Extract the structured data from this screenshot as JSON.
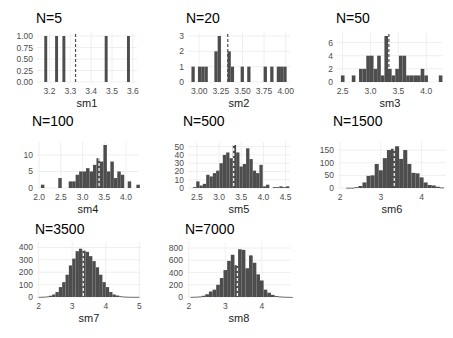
{
  "colors": {
    "bar": "#4d4d4d",
    "grid": "#ebebeb",
    "tick_text": "#4d4d4d",
    "mean_line": "#4d4d4d"
  },
  "chart_data": [
    {
      "type": "bar",
      "title": "N=5",
      "xlabel": "sm1",
      "ylabel": "",
      "xlim": [
        3.14,
        3.62
      ],
      "ylim": [
        0,
        1.0
      ],
      "xticks": [
        "3.2",
        "3.3",
        "3.4",
        "3.5",
        "3.6"
      ],
      "xtick_values": [
        3.2,
        3.3,
        3.4,
        3.5,
        3.6
      ],
      "yticks": [
        "0.00",
        "0.25",
        "0.50",
        "0.75",
        "1.00"
      ],
      "ytick_values": [
        0,
        0.25,
        0.5,
        0.75,
        1.0
      ],
      "bin_width": 0.014,
      "mean": 3.325,
      "bins_x": [
        3.175,
        3.227,
        3.262,
        3.465,
        3.572
      ],
      "values": [
        1,
        1,
        1,
        1,
        1
      ]
    },
    {
      "type": "bar",
      "title": "N=20",
      "xlabel": "sm2",
      "ylabel": "",
      "xlim": [
        2.87,
        4.05
      ],
      "ylim": [
        0,
        3
      ],
      "xticks": [
        "3.00",
        "3.25",
        "3.50",
        "3.75",
        "4.00"
      ],
      "xtick_values": [
        3.0,
        3.25,
        3.5,
        3.75,
        4.0
      ],
      "yticks": [
        "0",
        "1",
        "2",
        "3"
      ],
      "ytick_values": [
        0,
        1,
        2,
        3
      ],
      "bin_width": 0.038,
      "mean": 3.33,
      "bins_x": [
        2.91,
        2.985,
        3.023,
        3.061,
        3.175,
        3.213,
        3.327,
        3.365,
        3.479,
        3.555,
        3.745,
        3.821,
        3.897,
        3.935,
        3.973
      ],
      "values": [
        1,
        1,
        1,
        1,
        2,
        3,
        2,
        1,
        1,
        1,
        1,
        1,
        1,
        1,
        1
      ]
    },
    {
      "type": "bar",
      "title": "N=50",
      "xlabel": "sm3",
      "ylabel": "",
      "xlim": [
        2.4,
        4.3
      ],
      "ylim": [
        0,
        7
      ],
      "xticks": [
        "2.5",
        "3.0",
        "3.5",
        "4.0"
      ],
      "xtick_values": [
        2.5,
        3.0,
        3.5,
        4.0
      ],
      "yticks": [
        "0",
        "2",
        "4",
        "6"
      ],
      "ytick_values": [
        0,
        2,
        4,
        6
      ],
      "bin_width": 0.065,
      "mean": 3.33,
      "bins_x": [
        2.47,
        2.665,
        2.795,
        2.86,
        2.925,
        2.99,
        3.055,
        3.12,
        3.185,
        3.25,
        3.315,
        3.38,
        3.445,
        3.51,
        3.575,
        3.64,
        3.705,
        3.77,
        3.835,
        3.9,
        3.965,
        4.225
      ],
      "values": [
        1,
        1,
        2,
        2,
        4,
        4,
        2,
        4,
        1,
        7,
        2,
        1,
        2,
        4,
        4,
        1,
        1,
        1,
        1,
        2,
        1,
        1
      ]
    },
    {
      "type": "bar",
      "title": "N=100",
      "xlabel": "sm4",
      "ylabel": "",
      "xlim": [
        1.95,
        4.3
      ],
      "ylim": [
        0,
        13
      ],
      "xticks": [
        "2.0",
        "2.5",
        "3.0",
        "3.5",
        "4.0"
      ],
      "xtick_values": [
        2.0,
        2.5,
        3.0,
        3.5,
        4.0
      ],
      "yticks": [
        "0",
        "5",
        "10"
      ],
      "ytick_values": [
        0,
        5,
        10
      ],
      "bin_width": 0.08,
      "mean": 3.38,
      "bins_x": [
        2.04,
        2.44,
        2.68,
        2.76,
        2.84,
        2.92,
        3.0,
        3.08,
        3.16,
        3.24,
        3.32,
        3.4,
        3.48,
        3.56,
        3.64,
        3.72,
        3.8,
        3.88,
        4.04,
        4.24
      ],
      "values": [
        1,
        3,
        2,
        2,
        4,
        5,
        5,
        6,
        5,
        7,
        9,
        8,
        13,
        5,
        8,
        3,
        5,
        4,
        2,
        1
      ]
    },
    {
      "type": "bar",
      "title": "N=500",
      "xlabel": "sm5",
      "ylabel": "",
      "xlim": [
        2.3,
        4.6
      ],
      "ylim": [
        0,
        52
      ],
      "xticks": [
        "2.5",
        "3.0",
        "3.5",
        "4.0",
        "4.5"
      ],
      "xtick_values": [
        2.5,
        3.0,
        3.5,
        4.0,
        4.5
      ],
      "yticks": [
        "0",
        "10",
        "20",
        "30",
        "40",
        "50"
      ],
      "ytick_values": [
        0,
        10,
        20,
        30,
        40,
        50
      ],
      "bin_width": 0.075,
      "mean": 3.33,
      "bins_x": [
        2.41,
        2.485,
        2.56,
        2.635,
        2.71,
        2.785,
        2.86,
        2.935,
        3.01,
        3.085,
        3.16,
        3.235,
        3.31,
        3.385,
        3.46,
        3.535,
        3.61,
        3.685,
        3.76,
        3.835,
        3.91,
        3.985,
        4.06,
        4.21,
        4.285,
        4.36,
        4.435,
        4.51
      ],
      "values": [
        1,
        8,
        3,
        5,
        16,
        14,
        18,
        21,
        30,
        40,
        43,
        36,
        52,
        43,
        26,
        29,
        48,
        35,
        21,
        18,
        28,
        2,
        4,
        1,
        1,
        2,
        1,
        2
      ]
    },
    {
      "type": "bar",
      "title": "N=1500",
      "xlabel": "sm6",
      "ylabel": "",
      "xlim": [
        1.95,
        4.6
      ],
      "ylim": [
        0,
        170
      ],
      "xticks": [
        "2",
        "3",
        "4"
      ],
      "xtick_values": [
        2,
        3,
        4
      ],
      "yticks": [
        "0",
        "50",
        "100",
        "150"
      ],
      "ytick_values": [
        0,
        50,
        100,
        150
      ],
      "bin_width": 0.1,
      "mean": 3.33,
      "bins_x": [
        2.15,
        2.25,
        2.35,
        2.45,
        2.55,
        2.65,
        2.75,
        2.85,
        2.95,
        3.05,
        3.15,
        3.25,
        3.35,
        3.45,
        3.55,
        3.65,
        3.75,
        3.85,
        3.95,
        4.05,
        4.15,
        4.25,
        4.35,
        4.45
      ],
      "values": [
        1,
        1,
        3,
        8,
        22,
        48,
        50,
        95,
        70,
        118,
        150,
        155,
        165,
        115,
        150,
        95,
        60,
        58,
        42,
        22,
        12,
        10,
        5,
        2
      ]
    },
    {
      "type": "bar",
      "title": "N=3500",
      "xlabel": "sm7",
      "ylabel": "",
      "xlim": [
        1.95,
        5.05
      ],
      "ylim": [
        0,
        420
      ],
      "xticks": [
        "2",
        "3",
        "4",
        "5"
      ],
      "xtick_values": [
        2,
        3,
        4,
        5
      ],
      "yticks": [
        "0",
        "100",
        "200",
        "300",
        "400"
      ],
      "ytick_values": [
        0,
        100,
        200,
        300,
        400
      ],
      "bin_width": 0.1,
      "mean": 3.33,
      "bins_x": [
        2.0,
        2.1,
        2.2,
        2.3,
        2.4,
        2.5,
        2.6,
        2.7,
        2.8,
        2.9,
        3.0,
        3.1,
        3.2,
        3.3,
        3.4,
        3.5,
        3.6,
        3.7,
        3.8,
        3.9,
        4.0,
        4.1,
        4.2,
        4.3,
        4.4,
        4.5,
        4.6,
        4.7,
        4.8,
        4.9
      ],
      "values": [
        1,
        2,
        4,
        10,
        20,
        40,
        80,
        120,
        180,
        255,
        310,
        370,
        390,
        375,
        365,
        330,
        290,
        240,
        180,
        120,
        80,
        40,
        20,
        12,
        6,
        3,
        2,
        1,
        1,
        1
      ]
    },
    {
      "type": "bar",
      "title": "N=7000",
      "xlabel": "sm8",
      "ylabel": "",
      "xlim": [
        1.95,
        4.8
      ],
      "ylim": [
        0,
        850
      ],
      "xticks": [
        "2",
        "3",
        "4"
      ],
      "xtick_values": [
        2,
        3,
        4
      ],
      "yticks": [
        "0",
        "200",
        "400",
        "600",
        "800"
      ],
      "ytick_values": [
        0,
        200,
        400,
        600,
        800
      ],
      "bin_width": 0.1,
      "mean": 3.33,
      "bins_x": [
        2.05,
        2.15,
        2.25,
        2.35,
        2.45,
        2.55,
        2.65,
        2.75,
        2.85,
        2.95,
        3.05,
        3.15,
        3.25,
        3.35,
        3.45,
        3.55,
        3.65,
        3.75,
        3.85,
        3.95,
        4.05,
        4.15,
        4.25,
        4.35,
        4.45,
        4.55,
        4.65,
        4.75
      ],
      "values": [
        2,
        4,
        8,
        20,
        45,
        90,
        120,
        200,
        310,
        440,
        590,
        690,
        520,
        780,
        770,
        470,
        680,
        560,
        370,
        270,
        120,
        70,
        35,
        15,
        8,
        4,
        2,
        1
      ]
    }
  ]
}
